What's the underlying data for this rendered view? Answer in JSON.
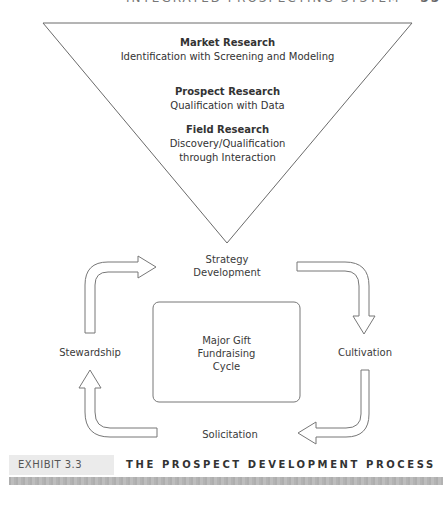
{
  "running_head": {
    "text": "INTEGRATED PROSPECTING SYSTEM",
    "page_number": "55"
  },
  "funnel": {
    "stages": [
      {
        "title": "Market Research",
        "subtitle_lines": [
          "Identification with Screening and Modeling"
        ]
      },
      {
        "title": "Prospect Research",
        "subtitle_lines": [
          "Qualification with Data"
        ]
      },
      {
        "title": "Field Research",
        "subtitle_lines": [
          "Discovery/Qualification",
          "through Interaction"
        ]
      }
    ]
  },
  "cycle": {
    "center_lines": [
      "Major Gift",
      "Fundraising",
      "Cycle"
    ],
    "steps": {
      "top": [
        "Strategy",
        "Development"
      ],
      "right": [
        "Cultivation"
      ],
      "bottom": [
        "Solicitation"
      ],
      "left": [
        "Stewardship"
      ]
    },
    "flow_order": [
      "Strategy Development",
      "Cultivation",
      "Solicitation",
      "Stewardship"
    ]
  },
  "exhibit": {
    "label": "EXHIBIT 3.3",
    "title": "THE PROSPECT DEVELOPMENT PROCESS"
  }
}
